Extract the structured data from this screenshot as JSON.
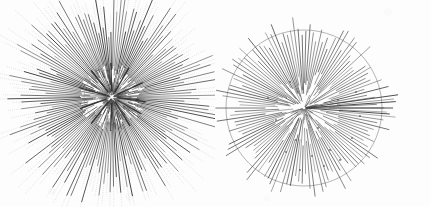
{
  "figure": {
    "title": "",
    "background_color": "#fdfdfd",
    "width": 431,
    "height": 207,
    "panel_count": 2
  },
  "chart_data": {
    "type": "scatter",
    "title": "",
    "subtitle": "",
    "xlabel": "",
    "ylabel": "",
    "grid": false,
    "legend_position": "none",
    "xlim": [
      0,
      431
    ],
    "ylim": [
      0,
      207
    ],
    "annotations": [],
    "panels": [
      {
        "name": "left-radial-tree",
        "label": "",
        "center": [
          112,
          97
        ],
        "inner_circle_radius": 28,
        "inner_circle_color": "#8a8a8a",
        "inner_circle_stroke_width": 0.5,
        "branch_color": "#3a3a3a",
        "branch_stroke_width": 0.7,
        "halo_color": "#b9b9b9",
        "halo_style": "dotted",
        "tip_count": 168,
        "max_radius": 110,
        "min_radius": 12,
        "dense_core": true,
        "branches": [
          {
            "angle": 0,
            "r0": 30,
            "r1": 78,
            "dot_r1": 100
          },
          {
            "angle": 2.1,
            "r0": 27,
            "r1": 84,
            "dot_r1": 104
          },
          {
            "angle": 4.3,
            "r0": 32,
            "r1": 70,
            "dot_r1": 95
          },
          {
            "angle": 6.4,
            "r0": 24,
            "r1": 88,
            "dot_r1": 106
          },
          {
            "angle": 8.6,
            "r0": 29,
            "r1": 75,
            "dot_r1": 98
          },
          {
            "angle": 10.7,
            "r0": 22,
            "r1": 92,
            "dot_r1": 108
          },
          {
            "angle": 12.9,
            "r0": 31,
            "r1": 68,
            "dot_r1": 92
          },
          {
            "angle": 15.0,
            "r0": 26,
            "r1": 86,
            "dot_r1": 103
          },
          {
            "angle": 17.1,
            "r0": 19,
            "r1": 80,
            "dot_r1": 99
          },
          {
            "angle": 19.3,
            "r0": 33,
            "r1": 73,
            "dot_r1": 96
          },
          {
            "angle": 21.4,
            "r0": 28,
            "r1": 90,
            "dot_r1": 107
          },
          {
            "angle": 23.6,
            "r0": 23,
            "r1": 82,
            "dot_r1": 101
          },
          {
            "angle": 25.7,
            "r0": 30,
            "r1": 76,
            "dot_r1": 97
          },
          {
            "angle": 27.9,
            "r0": 25,
            "r1": 94,
            "dot_r1": 110
          },
          {
            "angle": 30.0,
            "r0": 21,
            "r1": 79,
            "dot_r1": 100
          }
        ]
      },
      {
        "name": "right-radial-tree",
        "label": "",
        "center": [
          304,
          108
        ],
        "outer_circle_radius": 78,
        "outer_circle_color": "#7c7c7c",
        "outer_circle_stroke_width": 0.6,
        "branch_color": "#4a4a4a",
        "branch_stroke_width": 0.7,
        "node_dot_color": "#555555",
        "node_dot_radius": 0.9,
        "tip_count": 126,
        "max_radius": 95,
        "min_radius": 5,
        "long_spine_angles": [
          352,
          356,
          0,
          4
        ],
        "node_dots": [
          [
            296,
            140
          ],
          [
            318,
            128
          ],
          [
            330,
            150
          ],
          [
            312,
            156
          ],
          [
            340,
            160
          ],
          [
            286,
            152
          ],
          [
            324,
            166
          ],
          [
            352,
            138
          ],
          [
            276,
            120
          ],
          [
            360,
            116
          ],
          [
            300,
            170
          ],
          [
            338,
            100
          ],
          [
            268,
            98
          ],
          [
            356,
            92
          ],
          [
            290,
            82
          ]
        ],
        "branches": [
          {
            "angle": 0,
            "r0": 6,
            "r1": 96
          },
          {
            "angle": 3,
            "r0": 8,
            "r1": 88
          },
          {
            "angle": 6,
            "r0": 5,
            "r1": 80
          },
          {
            "angle": 9,
            "r0": 10,
            "r1": 92
          },
          {
            "angle": 12,
            "r0": 7,
            "r1": 74
          },
          {
            "angle": 15,
            "r0": 12,
            "r1": 85
          },
          {
            "angle": 18,
            "r0": 6,
            "r1": 70
          },
          {
            "angle": 21,
            "r0": 9,
            "r1": 90
          },
          {
            "angle": 24,
            "r0": 14,
            "r1": 66
          },
          {
            "angle": 27,
            "r0": 8,
            "r1": 82
          }
        ]
      }
    ]
  }
}
